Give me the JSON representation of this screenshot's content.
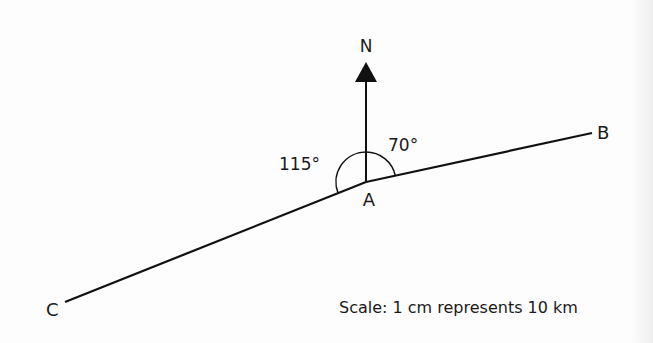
{
  "diagram": {
    "north_label": "N",
    "points": {
      "A": {
        "label": "A",
        "x": 366,
        "y": 182
      },
      "B": {
        "label": "B",
        "x": 592,
        "y": 133
      },
      "C": {
        "label": "C",
        "x": 65,
        "y": 302
      }
    },
    "angles": {
      "north_to_B": "70°",
      "north_to_C": "115°"
    },
    "scale_text": "Scale: 1 cm represents 10 km",
    "colors": {
      "line": "#111111",
      "background": "#fdfdfd"
    }
  }
}
